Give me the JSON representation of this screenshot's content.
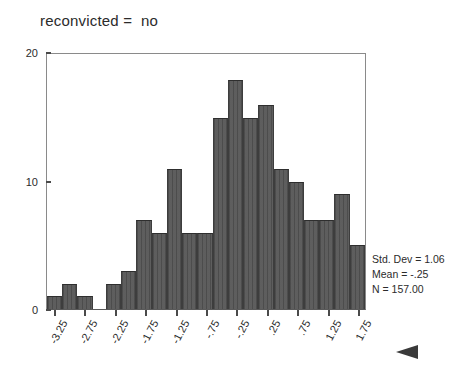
{
  "chart_data": {
    "type": "bar",
    "title": "reconvicted =  no",
    "subtitle": "",
    "xlabel": "",
    "ylabel": "",
    "ylim": [
      0,
      20
    ],
    "y_ticks": [
      0,
      10,
      20
    ],
    "y_tick_labels": [
      "0",
      "10",
      "20"
    ],
    "grid": false,
    "legend": null,
    "bin_width": 0.25,
    "x_range": [
      -3.5,
      1.75
    ],
    "categories": [
      "-3.375",
      "-3.125",
      "-2.875",
      "-2.625",
      "-2.375",
      "-2.125",
      "-1.875",
      "-1.625",
      "-1.375",
      "-1.125",
      "-0.875",
      "-0.625",
      "-0.375",
      "-0.125",
      "0.125",
      "0.375",
      "0.625",
      "0.875",
      "1.125",
      "1.375",
      "1.625"
    ],
    "values": [
      1,
      2,
      1,
      0,
      2,
      3,
      7,
      6,
      11,
      6,
      6,
      15,
      18,
      15,
      16,
      11,
      10,
      7,
      7,
      9,
      5
    ],
    "x_tick_labels": [
      "-3.25",
      "-2.75",
      "-2.25",
      "-1.75",
      "-1.25",
      "-.75",
      "-.25",
      ".25",
      ".75",
      "1.25",
      "1.75"
    ],
    "bar_color": "#555555",
    "annotations": {
      "std_dev": "Std. Dev = 1.06",
      "mean": "Mean = -.25",
      "n": "N = 157.00"
    }
  }
}
